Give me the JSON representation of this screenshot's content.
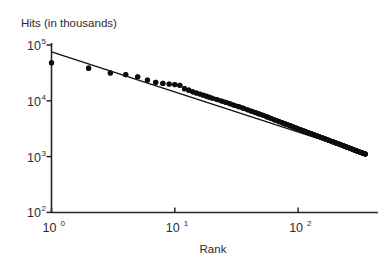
{
  "figure": {
    "background_color": "#ffffff",
    "ink_color": "#111111"
  },
  "chart_data": {
    "type": "scatter",
    "title": "",
    "subtitle": "",
    "ylabel": "Hits (in thousands)",
    "xlabel": "Rank",
    "xscale": "log",
    "yscale": "log",
    "xlim": [
      1,
      400
    ],
    "ylim": [
      100,
      100000
    ],
    "grid": false,
    "legend": null,
    "annotations": [],
    "xticks": [
      {
        "value": 1,
        "label": "10",
        "exponent": "0"
      },
      {
        "value": 10,
        "label": "10",
        "exponent": "1"
      },
      {
        "value": 100,
        "label": "10",
        "exponent": "2"
      }
    ],
    "yticks": [
      {
        "value": 100000,
        "label": "10",
        "exponent": "5"
      },
      {
        "value": 10000,
        "label": "10",
        "exponent": "4"
      },
      {
        "value": 1000,
        "label": "10",
        "exponent": "3"
      },
      {
        "value": 100,
        "label": "10",
        "exponent": "2"
      }
    ],
    "series": [
      {
        "name": "Hits vs Rank",
        "marker": "filled-circle",
        "marker_size_px": 2.6,
        "color": "#0d0d0d",
        "points": [
          [
            1,
            48000
          ],
          [
            2,
            38500
          ],
          [
            3,
            31500
          ],
          [
            4,
            29500
          ],
          [
            5,
            27000
          ],
          [
            6,
            23500
          ],
          [
            7,
            21500
          ],
          [
            8,
            20500
          ],
          [
            9,
            20000
          ],
          [
            10,
            19500
          ],
          [
            11,
            19000
          ],
          [
            12,
            16500
          ],
          [
            13,
            15500
          ],
          [
            14,
            14500
          ],
          [
            15,
            13800
          ],
          [
            16,
            13200
          ],
          [
            17,
            12600
          ],
          [
            18,
            12100
          ],
          [
            19,
            11600
          ],
          [
            20,
            11200
          ],
          [
            22,
            10500
          ],
          [
            24,
            9900
          ],
          [
            26,
            9350
          ],
          [
            28,
            8850
          ],
          [
            30,
            8400
          ],
          [
            33,
            7850
          ],
          [
            36,
            7350
          ],
          [
            39,
            6900
          ],
          [
            42,
            6500
          ],
          [
            45,
            6150
          ],
          [
            48,
            5850
          ],
          [
            52,
            5500
          ],
          [
            56,
            5150
          ],
          [
            60,
            4850
          ],
          [
            65,
            4520
          ],
          [
            70,
            4250
          ],
          [
            75,
            4000
          ],
          [
            80,
            3800
          ],
          [
            86,
            3580
          ],
          [
            92,
            3380
          ],
          [
            98,
            3200
          ],
          [
            105,
            3020
          ],
          [
            112,
            2860
          ],
          [
            120,
            2700
          ],
          [
            128,
            2560
          ],
          [
            137,
            2420
          ],
          [
            146,
            2300
          ],
          [
            156,
            2180
          ],
          [
            167,
            2060
          ],
          [
            178,
            1950
          ],
          [
            190,
            1850
          ],
          [
            203,
            1750
          ],
          [
            217,
            1660
          ],
          [
            232,
            1570
          ],
          [
            248,
            1480
          ],
          [
            265,
            1400
          ],
          [
            283,
            1320
          ],
          [
            302,
            1250
          ],
          [
            320,
            1190
          ],
          [
            335,
            1150
          ],
          [
            345,
            1125
          ],
          [
            352,
            1110
          ]
        ]
      }
    ],
    "fit_line": {
      "name": "power-law fit",
      "description": "straight line on log-log axes",
      "endpoints": [
        [
          1,
          75000
        ],
        [
          352,
          1120
        ]
      ],
      "slope_loglog": -0.74,
      "color": "#111111"
    }
  }
}
